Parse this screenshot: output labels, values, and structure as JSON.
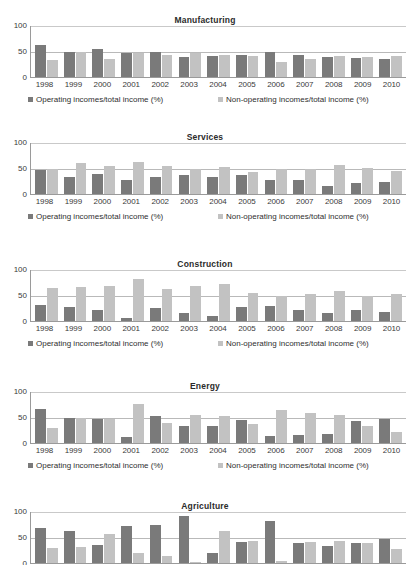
{
  "page": {
    "cut_off_header_text": "",
    "series_labels": {
      "operating": "Operating incomes/total income (%)",
      "non_operating": "Non-operating incomes/total income (%)"
    },
    "colors": {
      "operating": "#7a7a7a",
      "non_operating": "#c2c2c2",
      "axis": "#9a9a9a",
      "grid": "#b9b9b9",
      "text": "#3a3a3a"
    }
  },
  "chart_data": [
    {
      "type": "bar",
      "title": "Manufacturing",
      "xlabel": "",
      "ylabel": "",
      "ylim": [
        0,
        100
      ],
      "yticks": [
        0,
        50,
        100
      ],
      "grid": true,
      "legend_position": "bottom",
      "categories": [
        "1998",
        "1999",
        "2000",
        "2001",
        "2002",
        "2003",
        "2004",
        "2005",
        "2006",
        "2007",
        "2008",
        "2009",
        "2010"
      ],
      "series": [
        {
          "name": "Operating incomes/total income (%)",
          "values": [
            62,
            48,
            54,
            47,
            48,
            38,
            41,
            42,
            48,
            43,
            39,
            37,
            34
          ]
        },
        {
          "name": "Non-operating incomes/total income (%)",
          "values": [
            32,
            48,
            35,
            47,
            42,
            46,
            43,
            40,
            29,
            34,
            41,
            39,
            40
          ]
        }
      ]
    },
    {
      "type": "bar",
      "title": "Services",
      "xlabel": "",
      "ylabel": "",
      "ylim": [
        0,
        100
      ],
      "yticks": [
        0,
        50,
        100
      ],
      "grid": true,
      "legend_position": "bottom",
      "categories": [
        "1998",
        "1999",
        "2000",
        "2001",
        "2002",
        "2003",
        "2004",
        "2005",
        "2006",
        "2007",
        "2008",
        "2009",
        "2010"
      ],
      "series": [
        {
          "name": "Operating incomes/total income (%)",
          "values": [
            46,
            32,
            38,
            27,
            32,
            36,
            32,
            37,
            27,
            26,
            15,
            21,
            24
          ]
        },
        {
          "name": "Non-operating incomes/total income (%)",
          "values": [
            49,
            59,
            54,
            61,
            53,
            48,
            51,
            43,
            49,
            48,
            56,
            50,
            45
          ]
        }
      ]
    },
    {
      "type": "bar",
      "title": "Construction",
      "xlabel": "",
      "ylabel": "",
      "ylim": [
        0,
        100
      ],
      "yticks": [
        0,
        50,
        100
      ],
      "grid": true,
      "legend_position": "bottom",
      "categories": [
        "1998",
        "1999",
        "2000",
        "2001",
        "2002",
        "2003",
        "2004",
        "2005",
        "2006",
        "2007",
        "2008",
        "2009",
        "2010"
      ],
      "series": [
        {
          "name": "Operating incomes/total income (%)",
          "values": [
            31,
            27,
            22,
            6,
            25,
            15,
            9,
            27,
            29,
            22,
            16,
            22,
            17
          ]
        },
        {
          "name": "Non-operating incomes/total income (%)",
          "values": [
            63,
            66,
            68,
            80,
            62,
            68,
            72,
            53,
            48,
            52,
            57,
            49,
            52
          ]
        }
      ]
    },
    {
      "type": "bar",
      "title": "Energy",
      "xlabel": "",
      "ylabel": "",
      "ylim": [
        0,
        100
      ],
      "yticks": [
        0,
        50,
        100
      ],
      "grid": true,
      "legend_position": "bottom",
      "categories": [
        "1998",
        "1999",
        "2000",
        "2001",
        "2002",
        "2003",
        "2004",
        "2005",
        "2006",
        "2007",
        "2008",
        "2009",
        "2010"
      ],
      "series": [
        {
          "name": "Operating incomes/total income (%)",
          "values": [
            66,
            48,
            47,
            11,
            51,
            32,
            33,
            45,
            14,
            16,
            18,
            42,
            47
          ]
        },
        {
          "name": "Non-operating incomes/total income (%)",
          "values": [
            28,
            48,
            47,
            75,
            38,
            53,
            51,
            37,
            63,
            58,
            54,
            32,
            22
          ]
        }
      ]
    },
    {
      "type": "bar",
      "title": "Agriculture",
      "xlabel": "",
      "ylabel": "",
      "ylim": [
        0,
        100
      ],
      "yticks": [
        0,
        50,
        100
      ],
      "grid": true,
      "legend_position": "bottom",
      "categories": [
        "1998",
        "1999",
        "2000",
        "2001",
        "2002",
        "2003",
        "2004",
        "2005",
        "2006",
        "2007",
        "2008",
        "2009",
        "2010"
      ],
      "series": [
        {
          "name": "Operating incomes/total income (%)",
          "values": [
            67,
            62,
            35,
            71,
            73,
            91,
            20,
            41,
            80,
            39,
            33,
            39,
            46
          ]
        },
        {
          "name": "Non-operating incomes/total income (%)",
          "values": [
            29,
            31,
            55,
            19,
            14,
            2,
            62,
            42,
            3,
            41,
            43,
            39,
            26
          ]
        }
      ]
    }
  ]
}
